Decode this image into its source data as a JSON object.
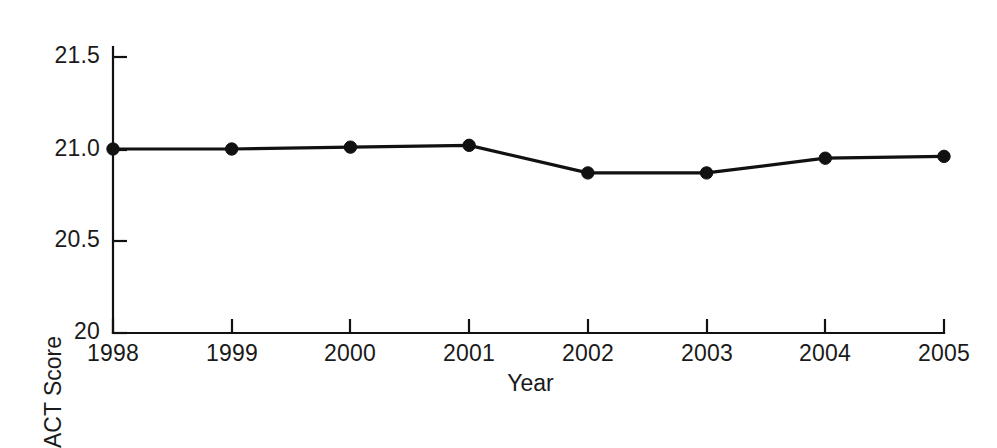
{
  "chart_data": {
    "type": "line",
    "title": "",
    "subtitle": "",
    "xlabel": "Year",
    "ylabel": "ACT Score",
    "categories": [
      "1998",
      "1999",
      "2000",
      "2001",
      "2002",
      "2003",
      "2004",
      "2005"
    ],
    "x": [
      1998,
      1999,
      2000,
      2001,
      2002,
      2003,
      2004,
      2005
    ],
    "values": [
      21.0,
      21.0,
      21.01,
      21.02,
      20.87,
      20.87,
      20.95,
      20.96
    ],
    "series": [
      {
        "name": "ACT Score",
        "values": [
          21.0,
          21.0,
          21.01,
          21.02,
          20.87,
          20.87,
          20.95,
          20.96
        ]
      }
    ],
    "ylim": [
      20,
      21.5
    ],
    "xlim": [
      1998,
      2005
    ],
    "yticks": [
      20,
      20.5,
      21.0,
      21.5
    ],
    "ytick_labels": [
      "20",
      "20.5",
      "21.0",
      "21.5"
    ],
    "xticks": [
      1998,
      1999,
      2000,
      2001,
      2002,
      2003,
      2004,
      2005
    ],
    "xtick_labels": [
      "1998",
      "1999",
      "2000",
      "2001",
      "2002",
      "2003",
      "2004",
      "2005"
    ],
    "grid": false,
    "legend": "none",
    "marker": "filled-circle",
    "line_color": "#111111",
    "marker_color": "#111111",
    "background_color": "#ffffff"
  },
  "axes": {
    "y_title": "ACT Score",
    "x_title": "Year",
    "y_tick_labels": [
      "21.5",
      "21.0",
      "20.5",
      "20"
    ],
    "x_tick_labels": [
      "1998",
      "1999",
      "2000",
      "2001",
      "2002",
      "2003",
      "2004",
      "2005"
    ]
  }
}
